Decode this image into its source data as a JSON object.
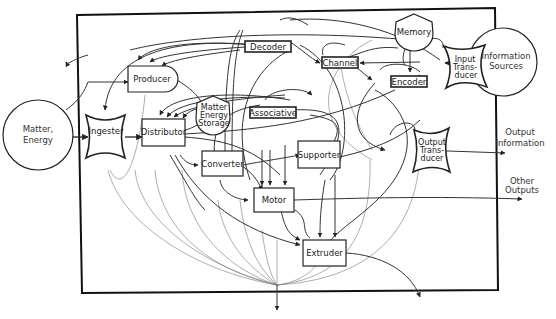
{
  "diagram": {
    "external_inputs": {
      "matter_energy": {
        "line1": "Matter,",
        "line2": "Energy"
      },
      "information_sources": {
        "line1": "Information",
        "line2": "Sources"
      }
    },
    "external_outputs": {
      "output_information": {
        "line1": "Output",
        "line2": "Information"
      },
      "other_outputs": {
        "line1": "Other",
        "line2": "Outputs"
      }
    },
    "subsystems": {
      "ingester": "Ingester",
      "producer": "Producer",
      "distributor": "Distributor",
      "matter_energy_storage": {
        "line1": "Matter",
        "line2": "Energy",
        "line3": "Storage"
      },
      "converter": "Converter",
      "motor": "Motor",
      "supporter": "Supporter",
      "extruder": "Extruder",
      "decoder": "Decoder",
      "associative": "Associative",
      "channel": "Channel",
      "memory": "Memory",
      "encoder": "Encoder",
      "input_transducer": {
        "line1": "Input",
        "line2": "Trans-",
        "line3": "ducer"
      },
      "output_transducer": {
        "line1": "Output",
        "line2": "Trans-",
        "line3": "ducer"
      }
    }
  }
}
